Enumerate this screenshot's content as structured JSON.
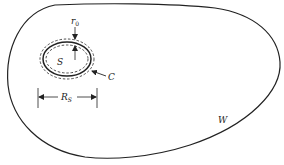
{
  "figure": {
    "region_outer_label": "W",
    "region_inner_label": "S",
    "contour_label": "C",
    "thickness_label_base": "r",
    "thickness_label_sub": "0",
    "radius_label_base": "R",
    "radius_label_sub": "S"
  },
  "colors": {
    "ink": "#222222",
    "background": "#ffffff"
  }
}
